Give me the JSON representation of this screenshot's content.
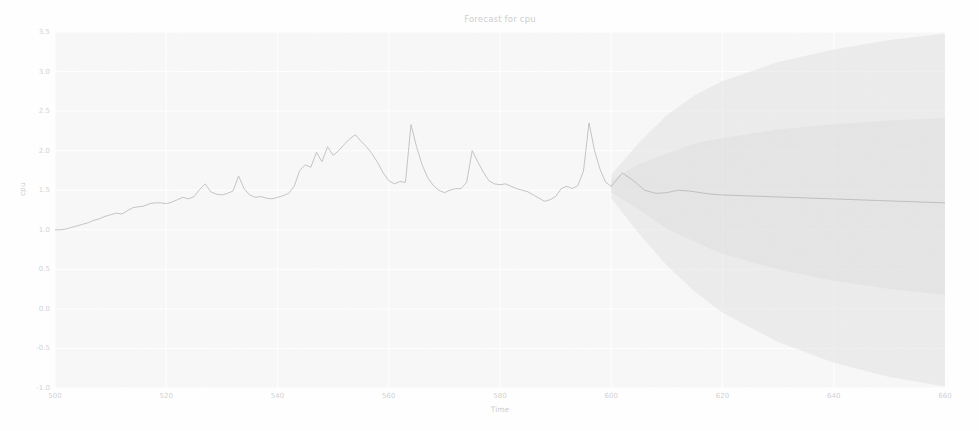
{
  "chart_data": {
    "type": "line",
    "title": "Forecast for cpu",
    "xlabel": "Time",
    "ylabel": "cpu",
    "xlim": [
      500,
      660
    ],
    "ylim": [
      -1.0,
      3.5
    ],
    "xticks": [
      500,
      520,
      540,
      560,
      580,
      600,
      620,
      640,
      660
    ],
    "xtick_labels": [
      "500",
      "520",
      "540",
      "560",
      "580",
      "600",
      "620",
      "640",
      "660"
    ],
    "yticks": [
      -1.0,
      -0.5,
      0.0,
      0.5,
      1.0,
      1.5,
      2.0,
      2.5,
      3.0,
      3.5
    ],
    "ytick_labels": [
      "-1.0",
      "-0.5",
      "0.0",
      "0.5",
      "1.0",
      "1.5",
      "2.0",
      "2.5",
      "3.0",
      "3.5"
    ],
    "grid": true,
    "legend": "none",
    "forecast_start": 600,
    "series": [
      {
        "name": "observed",
        "kind": "line",
        "color": "#8c8c8c",
        "x": [
          500,
          501,
          502,
          503,
          504,
          505,
          506,
          507,
          508,
          509,
          510,
          511,
          512,
          513,
          514,
          515,
          516,
          517,
          518,
          519,
          520,
          521,
          522,
          523,
          524,
          525,
          526,
          527,
          528,
          529,
          530,
          531,
          532,
          533,
          534,
          535,
          536,
          537,
          538,
          539,
          540,
          541,
          542,
          543,
          544,
          545,
          546,
          547,
          548,
          549,
          550,
          551,
          552,
          553,
          554,
          555,
          556,
          557,
          558,
          559,
          560,
          561,
          562,
          563,
          564,
          565,
          566,
          567,
          568,
          569,
          570,
          571,
          572,
          573,
          574,
          575,
          576,
          577,
          578,
          579,
          580,
          581,
          582,
          583,
          584,
          585,
          586,
          587,
          588,
          589,
          590,
          591,
          592,
          593,
          594,
          595,
          596,
          597,
          598,
          599,
          600
        ],
        "y": [
          1.0,
          1.0,
          1.01,
          1.03,
          1.05,
          1.07,
          1.09,
          1.12,
          1.14,
          1.17,
          1.19,
          1.21,
          1.2,
          1.24,
          1.28,
          1.29,
          1.3,
          1.33,
          1.34,
          1.34,
          1.33,
          1.35,
          1.38,
          1.41,
          1.39,
          1.42,
          1.51,
          1.58,
          1.48,
          1.45,
          1.44,
          1.46,
          1.49,
          1.68,
          1.52,
          1.44,
          1.41,
          1.42,
          1.4,
          1.39,
          1.41,
          1.43,
          1.46,
          1.55,
          1.75,
          1.82,
          1.79,
          1.98,
          1.86,
          2.05,
          1.94,
          2.0,
          2.08,
          2.15,
          2.2,
          2.12,
          2.05,
          1.96,
          1.85,
          1.72,
          1.62,
          1.58,
          1.61,
          1.6,
          2.33,
          2.05,
          1.82,
          1.66,
          1.56,
          1.5,
          1.47,
          1.5,
          1.52,
          1.52,
          1.6,
          2.0,
          1.86,
          1.73,
          1.62,
          1.58,
          1.57,
          1.58,
          1.55,
          1.52,
          1.5,
          1.48,
          1.44,
          1.4,
          1.36,
          1.38,
          1.42,
          1.52,
          1.55,
          1.52,
          1.56,
          1.74,
          2.35,
          2.0,
          1.76,
          1.6,
          1.55
        ]
      },
      {
        "name": "forecast_mean",
        "kind": "line",
        "color": "#8c8c8c",
        "x": [
          600,
          602,
          604,
          606,
          608,
          610,
          612,
          614,
          616,
          618,
          620,
          624,
          628,
          632,
          636,
          640,
          644,
          648,
          652,
          656,
          660
        ],
        "y": [
          1.55,
          1.72,
          1.62,
          1.5,
          1.46,
          1.47,
          1.5,
          1.49,
          1.47,
          1.45,
          1.44,
          1.43,
          1.42,
          1.41,
          1.4,
          1.39,
          1.38,
          1.37,
          1.36,
          1.35,
          1.34
        ]
      }
    ],
    "prediction_interval": {
      "name": "forecast interval",
      "color": "#c9c9c9",
      "x": [
        600,
        605,
        610,
        615,
        620,
        630,
        640,
        650,
        660
      ],
      "upper": [
        1.7,
        2.1,
        2.45,
        2.7,
        2.88,
        3.12,
        3.28,
        3.4,
        3.48
      ],
      "lower": [
        1.4,
        0.95,
        0.55,
        0.22,
        -0.05,
        -0.42,
        -0.68,
        -0.86,
        -0.98
      ]
    }
  },
  "figure": {
    "title": "Forecast for cpu",
    "xlabel": "Time",
    "ylabel": "cpu"
  }
}
